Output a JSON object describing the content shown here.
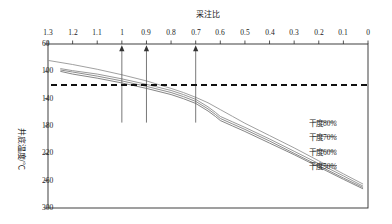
{
  "chart_data": {
    "type": "line",
    "title": "",
    "xlabel": "采注比",
    "ylabel": "井底温度/℃",
    "xlim": [
      0,
      1.3
    ],
    "ylim": [
      60,
      300
    ],
    "y_inverted": true,
    "grid": false,
    "legend_position": "lower-left",
    "x_ticks": [
      "0",
      "0.1",
      "0.2",
      "0.3",
      "0.4",
      "0.5",
      "0.6",
      "0.7",
      "0.8",
      "0.9",
      "1",
      "1.1",
      "1.2",
      "1.3"
    ],
    "y_ticks": [
      "60",
      "100",
      "140",
      "180",
      "220",
      "260",
      "300"
    ],
    "x_axis_position": "top",
    "y_axis_position": "right",
    "series": [
      {
        "name": "干度50%",
        "color": "#6f6f6f",
        "x": [
          0.02,
          0.1,
          0.2,
          0.3,
          0.4,
          0.5,
          0.55,
          0.6,
          0.62,
          0.65,
          0.7,
          0.75,
          0.8,
          0.9,
          1.0,
          1.1,
          1.2,
          1.25
        ],
        "y": [
          272,
          258,
          240,
          222,
          205,
          188,
          180,
          172,
          166,
          158,
          147,
          140,
          134,
          125,
          117,
          110,
          104,
          100
        ]
      },
      {
        "name": "干度60%",
        "color": "#7b7b7b",
        "x": [
          0.02,
          0.1,
          0.2,
          0.3,
          0.4,
          0.5,
          0.55,
          0.6,
          0.62,
          0.65,
          0.7,
          0.75,
          0.8,
          0.9,
          1.0,
          1.1,
          1.2,
          1.25
        ],
        "y": [
          270,
          256,
          238,
          220,
          202,
          185,
          177,
          169,
          163,
          155,
          144,
          137,
          131,
          122,
          114,
          107,
          101,
          98
        ]
      },
      {
        "name": "干度70%",
        "color": "#878787",
        "x": [
          0.02,
          0.1,
          0.2,
          0.3,
          0.4,
          0.5,
          0.55,
          0.6,
          0.62,
          0.65,
          0.7,
          0.75,
          0.8,
          0.9,
          1.0,
          1.1,
          1.2,
          1.25
        ],
        "y": [
          268,
          253,
          235,
          217,
          199,
          182,
          174,
          166,
          160,
          152,
          141,
          134,
          128,
          119,
          111,
          104,
          99,
          96
        ]
      },
      {
        "name": "干度80%",
        "color": "#8f8f8f",
        "x": [
          0.02,
          0.1,
          0.2,
          0.3,
          0.4,
          0.5,
          0.55,
          0.6,
          0.65,
          0.7,
          0.75,
          0.8,
          0.9,
          1.0,
          1.1,
          1.2,
          1.3
        ],
        "y": [
          265,
          250,
          231,
          212,
          194,
          176,
          166,
          156,
          146,
          138,
          131,
          125,
          114,
          105,
          97,
          90,
          84
        ]
      }
    ],
    "reference_line": {
      "name": "温度界限线",
      "orientation": "horizontal",
      "value": 120,
      "style": "dashed",
      "color": "#111111"
    },
    "annotations": [
      {
        "name": "arrow-1",
        "x": 0.7,
        "type": "vertical-arrow",
        "from_y": 175,
        "to_y": 62
      },
      {
        "name": "arrow-2",
        "x": 0.9,
        "type": "vertical-arrow",
        "from_y": 175,
        "to_y": 62
      },
      {
        "name": "arrow-3",
        "x": 1.0,
        "type": "vertical-arrow",
        "from_y": 175,
        "to_y": 62
      }
    ]
  },
  "legend": {
    "items": [
      {
        "label": "干度80%",
        "color": "#8f8f8f"
      },
      {
        "label": "干度70%",
        "color": "#878787"
      },
      {
        "label": "干度60%",
        "color": "#7b7b7b"
      },
      {
        "label": "干度50%",
        "color": "#6f6f6f"
      }
    ]
  }
}
